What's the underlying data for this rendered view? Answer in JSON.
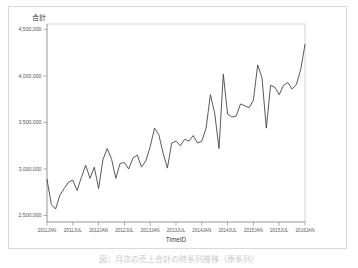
{
  "figure": {
    "title": "合計",
    "caption": "図：月次の売上合計の時系列推移（原系列）"
  },
  "axes": {
    "y_ticks": [
      "2,500,000",
      "3,000,000",
      "3,500,000",
      "4,000,000",
      "4,500,000"
    ],
    "y_tick_values": [
      2500000,
      3000000,
      3500000,
      4000000,
      4500000
    ],
    "x_ticks": [
      "2011JAN",
      "2011JUL",
      "2012JAN",
      "2012JUL",
      "2013JAN",
      "2013JUL",
      "2014JAN",
      "2014JUL",
      "2015JAN",
      "2015JUL",
      "2016JAN"
    ],
    "x_title": "TimeID",
    "y_title": "合計",
    "line_color": "#3b3b3b",
    "frame_color": "#c8c8c8"
  },
  "chart_data": {
    "type": "line",
    "title": "合計",
    "xlabel": "TimeID",
    "ylabel": "合計",
    "ylim": [
      2430000,
      4560000
    ],
    "grid": false,
    "legend": "none",
    "x_tick_labels": [
      "2011JAN",
      "2011JUL",
      "2012JAN",
      "2012JUL",
      "2013JAN",
      "2013JUL",
      "2014JAN",
      "2014JUL",
      "2015JAN",
      "2015JUL",
      "2016JAN"
    ],
    "y_tick_labels": [
      "2,500,000",
      "3,000,000",
      "3,500,000",
      "4,000,000",
      "4,500,000"
    ],
    "series": [
      {
        "name": "合計",
        "x": [
          "2011JAN",
          "2011FEB",
          "2011MAR",
          "2011APR",
          "2011MAY",
          "2011JUN",
          "2011JUL",
          "2011AUG",
          "2011SEP",
          "2011OCT",
          "2011NOV",
          "2011DEC",
          "2012JAN",
          "2012FEB",
          "2012MAR",
          "2012APR",
          "2012MAY",
          "2012JUN",
          "2012JUL",
          "2012AUG",
          "2012SEP",
          "2012OCT",
          "2012NOV",
          "2012DEC",
          "2013JAN",
          "2013FEB",
          "2013MAR",
          "2013APR",
          "2013MAY",
          "2013JUN",
          "2013JUL",
          "2013AUG",
          "2013SEP",
          "2013OCT",
          "2013NOV",
          "2013DEC",
          "2014JAN",
          "2014FEB",
          "2014MAR",
          "2014APR",
          "2014MAY",
          "2014JUN",
          "2014JUL",
          "2014AUG",
          "2014SEP",
          "2014OCT",
          "2014NOV",
          "2014DEC",
          "2015JAN",
          "2015FEB",
          "2015MAR",
          "2015APR",
          "2015MAY",
          "2015JUN",
          "2015JUL",
          "2015AUG",
          "2015SEP",
          "2015OCT",
          "2015NOV",
          "2015DEC",
          "2016JAN"
        ],
        "values": [
          2890000,
          2620000,
          2570000,
          2720000,
          2790000,
          2860000,
          2880000,
          2770000,
          2910000,
          3040000,
          2900000,
          3020000,
          2790000,
          3100000,
          3220000,
          3110000,
          2900000,
          3060000,
          3070000,
          3000000,
          3120000,
          3150000,
          3020000,
          3090000,
          3240000,
          3440000,
          3370000,
          3170000,
          3010000,
          3280000,
          3300000,
          3250000,
          3320000,
          3300000,
          3360000,
          3280000,
          3300000,
          3440000,
          3800000,
          3600000,
          3220000,
          4020000,
          3590000,
          3560000,
          3570000,
          3700000,
          3680000,
          3660000,
          3740000,
          4120000,
          3980000,
          3440000,
          3900000,
          3880000,
          3800000,
          3900000,
          3930000,
          3860000,
          3910000,
          4070000,
          4340000
        ],
        "color": "#3b3b3b"
      }
    ]
  }
}
